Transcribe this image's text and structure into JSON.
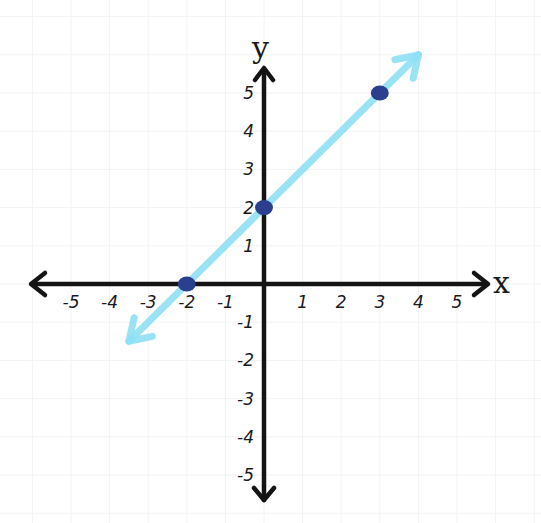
{
  "chart_data": {
    "type": "line",
    "title": "",
    "equation": "y = x + 2",
    "xlabel": "x",
    "ylabel": "y",
    "xlim": [
      -5,
      5
    ],
    "ylim": [
      -5,
      5
    ],
    "grid": true,
    "x_ticks": [
      "-5",
      "-4",
      "-3",
      "-2",
      "-1",
      "1",
      "2",
      "3",
      "4",
      "5"
    ],
    "y_ticks": [
      "5",
      "4",
      "3",
      "2",
      "1",
      "-1",
      "-2",
      "-3",
      "-4",
      "-5"
    ],
    "series": [
      {
        "name": "line",
        "color": "#8fe0f5",
        "x": [
          -3.5,
          4
        ],
        "y": [
          -1.5,
          6
        ],
        "arrows": "both"
      }
    ],
    "points": [
      {
        "x": -2,
        "y": 0,
        "color": "#2b3f8f"
      },
      {
        "x": 0,
        "y": 2,
        "color": "#2b3f8f"
      },
      {
        "x": 3,
        "y": 5,
        "color": "#2b3f8f"
      }
    ],
    "colors": {
      "axis": "#141414",
      "line": "#8fe0f5",
      "point": "#2b3f8f",
      "grid": "#f1f2f3"
    }
  }
}
